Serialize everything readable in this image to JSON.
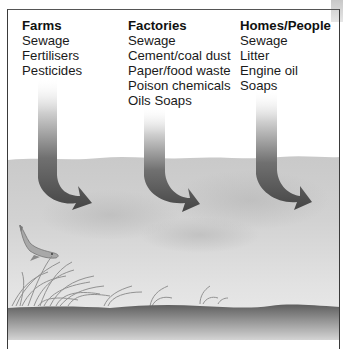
{
  "diagram": {
    "type": "water-pollution-sources-illustration",
    "sources": [
      {
        "heading": "Farms",
        "items": [
          "Sewage",
          "Fertilisers",
          "Pesticides"
        ]
      },
      {
        "heading": "Factories",
        "items": [
          "Sewage",
          "Cement/coal dust",
          "Paper/food waste",
          "Poison chemicals",
          "Oils Soaps"
        ]
      },
      {
        "heading": "Homes/People",
        "items": [
          "Sewage",
          "Litter",
          "Engine oil",
          "Soaps"
        ]
      }
    ],
    "elements": {
      "arrows": 3,
      "arrow_direction": "down-into-water",
      "scene": [
        "water-surface",
        "fish",
        "water-weeds",
        "riverbed"
      ]
    },
    "colors": {
      "text": "#1a1a1a",
      "arrow_dark": "#4a4a4a",
      "arrow_light": "#d8d8d8",
      "water": "#cfcfcf",
      "riverbed": "#6e6e6e"
    }
  }
}
